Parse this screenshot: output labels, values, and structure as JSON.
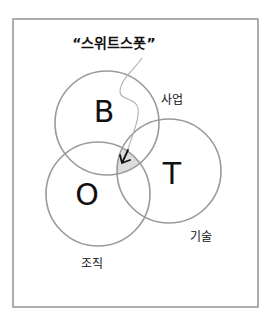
{
  "diagram": {
    "type": "venn",
    "frame": {
      "x": 13,
      "y": 19,
      "width": 245,
      "height": 288,
      "stroke": "#9a9a9a"
    },
    "circles": [
      {
        "id": "B",
        "letter": "B",
        "cx": 107,
        "cy": 123,
        "r": 52,
        "label": "사업",
        "label_x": 172,
        "label_y": 100,
        "letter_x": 104,
        "letter_y": 122
      },
      {
        "id": "O",
        "letter": "O",
        "cx": 98,
        "cy": 194,
        "r": 52,
        "label": "조직",
        "label_x": 92,
        "label_y": 264,
        "letter_x": 87,
        "letter_y": 199
      },
      {
        "id": "T",
        "letter": "T",
        "cx": 169,
        "cy": 171,
        "r": 52,
        "label": "기술",
        "label_x": 201,
        "label_y": 237,
        "letter_x": 173,
        "letter_y": 180
      }
    ],
    "circle_stroke": "#9a9a9a",
    "intersection_fill": "#dcdcdc",
    "callout": {
      "text": "“스위트스폿”",
      "x": 114,
      "y": 44
    }
  }
}
